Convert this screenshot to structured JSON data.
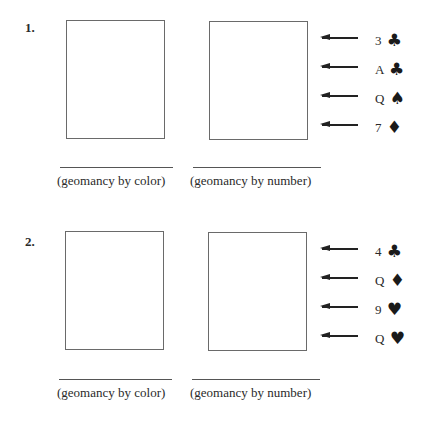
{
  "problems": [
    {
      "number": "1.",
      "caption_left": "(geomancy by color)",
      "caption_right": "(geomancy by number)",
      "cards": [
        {
          "rank": "3",
          "suit": "♣",
          "suit_name": "clubs"
        },
        {
          "rank": "A",
          "suit": "♣",
          "suit_name": "clubs"
        },
        {
          "rank": "Q",
          "suit": "♠",
          "suit_name": "spades"
        },
        {
          "rank": "7",
          "suit": "♦",
          "suit_name": "diamonds"
        }
      ]
    },
    {
      "number": "2.",
      "caption_left": "(geomancy by color)",
      "caption_right": "(geomancy by number)",
      "cards": [
        {
          "rank": "4",
          "suit": "♣",
          "suit_name": "clubs"
        },
        {
          "rank": "Q",
          "suit": "♦",
          "suit_name": "diamonds"
        },
        {
          "rank": "9",
          "suit": "♥",
          "suit_name": "hearts"
        },
        {
          "rank": "Q",
          "suit": "♥",
          "suit_name": "hearts"
        }
      ]
    }
  ]
}
